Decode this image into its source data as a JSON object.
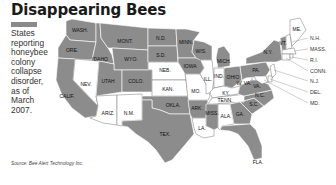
{
  "title": "Disappearing Bees",
  "legend": {
    "swatch_color": "#8a8a8a",
    "lines": [
      "States",
      "reporting",
      "honeybee",
      "colony",
      "collapse",
      "disorder,",
      "as of",
      "March",
      "2007."
    ]
  },
  "colors": {
    "shaded": "#8c8c8c",
    "unshaded": "#ffffff"
  },
  "states": {
    "shaded": [
      "WASH.",
      "ORE.",
      "IDAHO",
      "MONT.",
      "WYO.",
      "N.D.",
      "S.D.",
      "MINN.",
      "WIS.",
      "IOWA",
      "MICH.",
      "CALIF.",
      "UTAH",
      "COLO.",
      "OKLA.",
      "TEX.",
      "ARK.",
      "MISS.",
      "GA.",
      "S.C.",
      "N.C.",
      "VA.",
      "PA.",
      "N.Y.",
      "VT.",
      "OHIO",
      "FLA."
    ],
    "unshaded": [
      "NEV.",
      "ARIZ.",
      "N.M.",
      "NEB.",
      "KAN.",
      "MO.",
      "ILL.",
      "IND.",
      "KY.",
      "TENN.",
      "LA.",
      "ALA.",
      "W. VA.",
      "ME."
    ]
  },
  "labels": {
    "wash": "WASH.",
    "ore": "ORE.",
    "idaho": "IDAHO",
    "mont": "MONT.",
    "wyo": "WYO.",
    "nd": "N.D.",
    "sd": "S.D.",
    "neb": "NEB.",
    "kan": "KAN.",
    "okla": "OKLA.",
    "tex": "TEX.",
    "minn": "MINN.",
    "iowa": "IOWA",
    "mo": "MO.",
    "ark": "ARK.",
    "la": "LA.",
    "wis": "WIS.",
    "ill": "ILL.",
    "mich": "MICH.",
    "ind": "IND.",
    "ohio": "OHIO",
    "ky": "KY.",
    "tenn": "TENN.",
    "miss": "MISS.",
    "ala": "ALA.",
    "ga": "GA.",
    "fla": "FLA.",
    "sc": "S.C.",
    "nc": "N.C.",
    "va": "VA.",
    "wva": "W. VA.",
    "pa": "PA.",
    "ny": "N.Y.",
    "vt": "VT.",
    "me": "ME.",
    "nev": "NEV.",
    "calif": "CALIF.",
    "utah": "UTAH",
    "colo": "COLO.",
    "ariz": "ARIZ.",
    "nm": "N.M."
  },
  "callouts": [
    "N.H.",
    "MASS.",
    "R.I.",
    "CONN.",
    "N.J.",
    "DEL.",
    "MD."
  ],
  "source": "Source: Bee Alert Technology Inc."
}
